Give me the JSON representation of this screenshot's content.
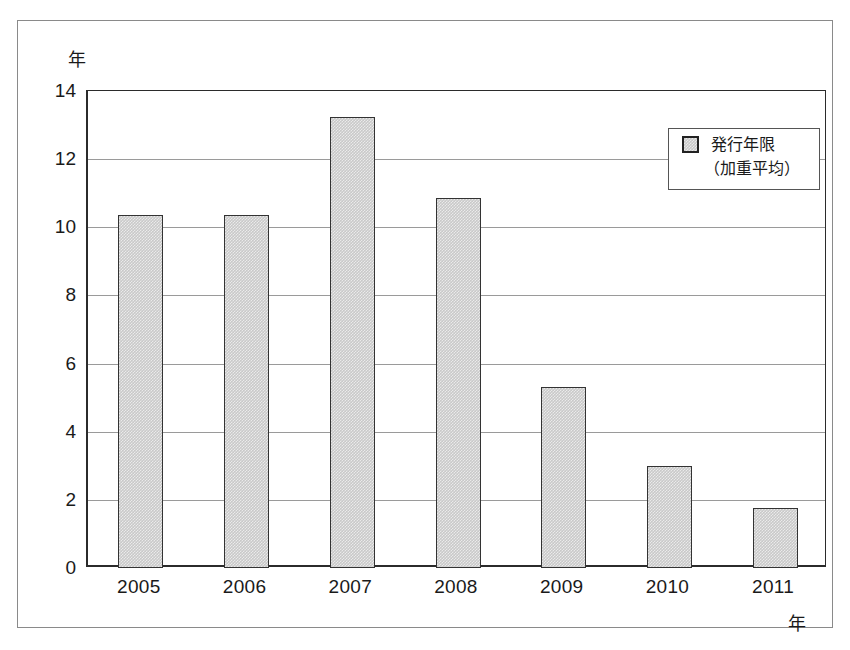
{
  "chart_data": {
    "type": "bar",
    "title": "",
    "subtitle": "",
    "xlabel": "年",
    "ylabel": "年",
    "categories": [
      "2005",
      "2006",
      "2007",
      "2008",
      "2009",
      "2010",
      "2011"
    ],
    "series": [
      {
        "name": "発行年限（加重平均）",
        "values": [
          10.35,
          10.35,
          13.25,
          10.85,
          5.3,
          3.0,
          1.75
        ]
      }
    ],
    "ylim": [
      0,
      14
    ],
    "ytick_step": 2,
    "yticks": [
      "14",
      "12",
      "10",
      "8",
      "6",
      "4",
      "2",
      "0"
    ],
    "ytick_values": [
      14,
      12,
      10,
      8,
      6,
      4,
      2,
      0
    ],
    "grid": true,
    "grid_axis": "y",
    "legend_position": "upper-right",
    "legend": {
      "label": "発行年限",
      "sublabel": "（加重平均）",
      "swatch_color": "#c9c9c9"
    },
    "colors": {
      "bar_fill": "#c9c9c9",
      "bar_edge": "#333333",
      "gridline": "#9a9a9a",
      "axis": "#2b2b2b",
      "frame": "#8a8a8a",
      "background": "#ffffff",
      "text": "#1a1a1a"
    }
  }
}
